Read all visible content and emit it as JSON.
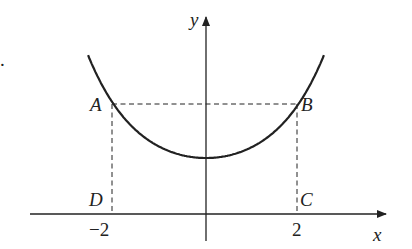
{
  "figure": {
    "fragment": ".",
    "axes": {
      "x_label": "x",
      "y_label": "y"
    },
    "ticks": [
      {
        "label": "−2",
        "value": -2
      },
      {
        "label": "2",
        "value": 2
      }
    ],
    "points": {
      "A": "A",
      "B": "B",
      "C": "C",
      "D": "D"
    },
    "curve": "U-shaped curve symmetric about the y-axis, minimum on the y-axis above the x-axis",
    "rectangle": "ABCD with A and B on the curve at x = -2 and x = 2, C and D on the x-axis (dashed lines)",
    "colors": {
      "ink": "#222222"
    }
  }
}
